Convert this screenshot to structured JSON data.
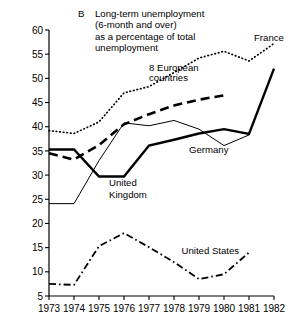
{
  "chart_data": {
    "type": "line",
    "panel_letter": "B",
    "title_lines": [
      "Long-term unemployment",
      "(6-month and over)",
      "as a percentage of total",
      "unemployment"
    ],
    "xlabel": "",
    "ylabel": "",
    "x": [
      1973,
      1974,
      1975,
      1976,
      1977,
      1978,
      1979,
      1980,
      1981,
      1982
    ],
    "xticklabels": [
      "1973",
      "1974",
      "1975",
      "1976",
      "1977",
      "1978",
      "1979",
      "1980",
      "1981",
      "1982"
    ],
    "xlim": [
      1973,
      1982
    ],
    "ylim": [
      5,
      60
    ],
    "yticks": [
      5,
      10,
      15,
      20,
      25,
      30,
      35,
      40,
      45,
      50,
      55,
      60
    ],
    "yticklabels": [
      "5",
      "10",
      "15",
      "20",
      "25",
      "30",
      "35",
      "40",
      "45",
      "50",
      "55",
      "60"
    ],
    "grid": false,
    "legend": "inline-annotations",
    "series": [
      {
        "name": "France",
        "label": "France",
        "style": "dotted",
        "color": "#000000",
        "x": [
          1973,
          1974,
          1975,
          1976,
          1977,
          1978,
          1979,
          1980,
          1981,
          1982
        ],
        "values": [
          39.2,
          38.6,
          41.0,
          47.0,
          48.3,
          51.2,
          54.2,
          55.6,
          53.6,
          57.2
        ]
      },
      {
        "name": "8 European countries",
        "label": "8 European countries",
        "style": "dashed",
        "color": "#000000",
        "x": [
          1973,
          1974,
          1975,
          1976,
          1977,
          1978,
          1979,
          1980
        ],
        "values": [
          34.5,
          33.2,
          36.2,
          40.5,
          42.6,
          44.4,
          45.6,
          46.5
        ]
      },
      {
        "name": "Germany",
        "label": "Germany",
        "style": "thin-solid",
        "color": "#000000",
        "x": [
          1973,
          1974,
          1975,
          1976,
          1977,
          1978,
          1979,
          1980,
          1981
        ],
        "values": [
          24.1,
          24.1,
          33.0,
          40.8,
          40.2,
          41.3,
          39.5,
          36.1,
          38.3
        ]
      },
      {
        "name": "United Kingdom",
        "label": "United Kingdom",
        "style": "thick-solid",
        "color": "#000000",
        "x": [
          1973,
          1974,
          1975,
          1976,
          1977,
          1978,
          1979,
          1980,
          1981,
          1982
        ],
        "values": [
          35.3,
          35.3,
          29.7,
          29.7,
          36.1,
          37.3,
          38.6,
          39.5,
          38.5,
          52.0
        ]
      },
      {
        "name": "United States",
        "label": "United States",
        "style": "dash-dot",
        "color": "#000000",
        "x": [
          1973,
          1974,
          1975,
          1976,
          1977,
          1978,
          1979,
          1980,
          1981
        ],
        "values": [
          7.5,
          7.3,
          15.3,
          18.0,
          15.1,
          12.0,
          8.5,
          9.5,
          14.0
        ]
      }
    ],
    "annotations": [
      {
        "name": "france-label",
        "text": "France",
        "x": 1981.2,
        "y": 57.8
      },
      {
        "name": "eight-european-countries-label",
        "text": "8 European",
        "x": 1977.0,
        "y": 51.6
      },
      {
        "name": "eight-european-countries-label-2",
        "text": "countries",
        "x": 1977.0,
        "y": 49.4
      },
      {
        "name": "germany-label",
        "text": "Germany",
        "x": 1978.6,
        "y": 34.6
      },
      {
        "name": "united-kingdom-label",
        "text": "United",
        "x": 1975.4,
        "y": 27.8
      },
      {
        "name": "united-kingdom-label-2",
        "text": "Kingdom",
        "x": 1975.4,
        "y": 25.2
      },
      {
        "name": "united-states-label",
        "text": "United States",
        "x": 1978.3,
        "y": 13.6
      }
    ]
  }
}
